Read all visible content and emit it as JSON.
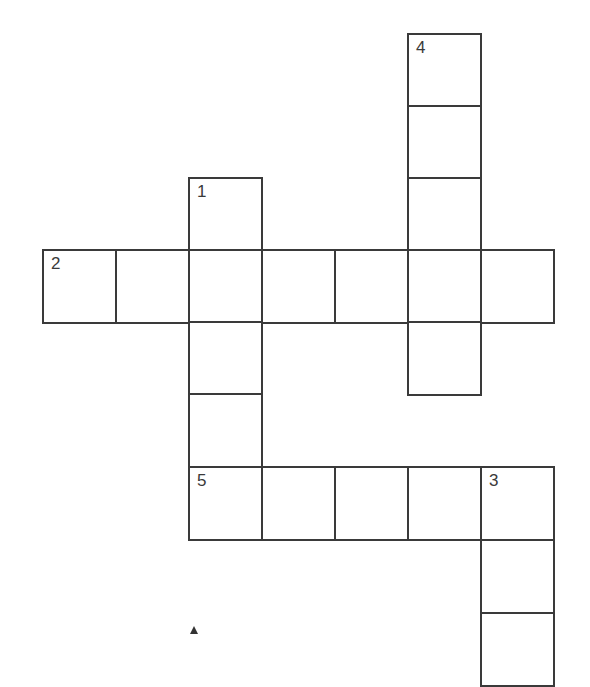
{
  "puzzle": {
    "type": "crossword",
    "cell_size": 73,
    "line_color": "#3a3a3a",
    "background": "#ffffff",
    "clue_numbers": [
      "1",
      "2",
      "3",
      "4",
      "5"
    ],
    "words": [
      {
        "number": "1",
        "direction": "down",
        "length": 5,
        "start": {
          "col": 2,
          "row": 2
        }
      },
      {
        "number": "2",
        "direction": "across",
        "length": 7,
        "start": {
          "col": 0,
          "row": 3
        }
      },
      {
        "number": "3",
        "direction": "down",
        "length": 3,
        "start": {
          "col": 6,
          "row": 6
        },
        "note": "continues below visible area"
      },
      {
        "number": "4",
        "direction": "down",
        "length": 5,
        "start": {
          "col": 5,
          "row": 0
        }
      },
      {
        "number": "5",
        "direction": "across",
        "length": 5,
        "start": {
          "col": 2,
          "row": 6
        }
      }
    ],
    "cells": [
      {
        "col": 5,
        "row": 0,
        "x": 407,
        "y": 33,
        "number": "4"
      },
      {
        "col": 5,
        "row": 1,
        "x": 407,
        "y": 105,
        "number": ""
      },
      {
        "col": 5,
        "row": 2,
        "x": 407,
        "y": 177,
        "number": ""
      },
      {
        "col": 2,
        "row": 2,
        "x": 188,
        "y": 177,
        "number": "1"
      },
      {
        "col": 0,
        "row": 3,
        "x": 42,
        "y": 249,
        "number": "2"
      },
      {
        "col": 1,
        "row": 3,
        "x": 115,
        "y": 249,
        "number": ""
      },
      {
        "col": 2,
        "row": 3,
        "x": 188,
        "y": 249,
        "number": ""
      },
      {
        "col": 3,
        "row": 3,
        "x": 261,
        "y": 249,
        "number": ""
      },
      {
        "col": 4,
        "row": 3,
        "x": 334,
        "y": 249,
        "number": ""
      },
      {
        "col": 5,
        "row": 3,
        "x": 407,
        "y": 249,
        "number": ""
      },
      {
        "col": 6,
        "row": 3,
        "x": 480,
        "y": 249,
        "number": ""
      },
      {
        "col": 2,
        "row": 4,
        "x": 188,
        "y": 321,
        "number": ""
      },
      {
        "col": 5,
        "row": 4,
        "x": 407,
        "y": 321,
        "number": ""
      },
      {
        "col": 2,
        "row": 5,
        "x": 188,
        "y": 393,
        "number": ""
      },
      {
        "col": 2,
        "row": 6,
        "x": 188,
        "y": 466,
        "number": "5"
      },
      {
        "col": 3,
        "row": 6,
        "x": 261,
        "y": 466,
        "number": ""
      },
      {
        "col": 4,
        "row": 6,
        "x": 334,
        "y": 466,
        "number": ""
      },
      {
        "col": 5,
        "row": 6,
        "x": 407,
        "y": 466,
        "number": ""
      },
      {
        "col": 6,
        "row": 6,
        "x": 480,
        "y": 466,
        "number": "3"
      },
      {
        "col": 6,
        "row": 7,
        "x": 480,
        "y": 539,
        "number": ""
      },
      {
        "col": 6,
        "row": 8,
        "x": 480,
        "y": 612,
        "number": ""
      }
    ]
  }
}
